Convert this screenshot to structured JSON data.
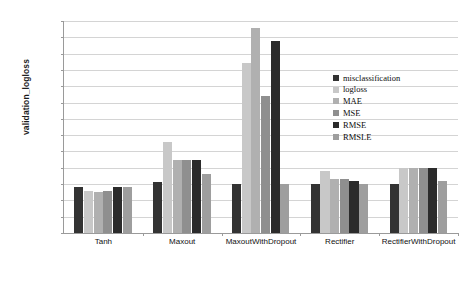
{
  "chart_data": {
    "type": "bar",
    "title": "",
    "xlabel": "",
    "ylabel": "validation_logloss",
    "ylim": [
      0,
      0.65
    ],
    "ytick_labels": [
      "0.65",
      "0.6",
      "0.55",
      "0.5",
      "0.45",
      "0.4",
      "0.35",
      "0.3",
      "0.25",
      "0.2",
      "0.15",
      "0.1",
      "0.05",
      "0"
    ],
    "ytick_values": [
      0.65,
      0.6,
      0.55,
      0.5,
      0.45,
      0.4,
      0.35,
      0.3,
      0.25,
      0.2,
      0.15,
      0.1,
      0.05,
      0
    ],
    "grid": true,
    "legend_position": "inside-upper-right",
    "categories": [
      "Tanh",
      "Maxout",
      "MaxoutWithDropout",
      "Rectifier",
      "RectifierWithDropout"
    ],
    "series": [
      {
        "name": "misclassification",
        "color": "#333333",
        "values": [
          0.14,
          0.155,
          0.15,
          0.15,
          0.15
        ]
      },
      {
        "name": "logloss",
        "color": "#c8c8c8",
        "values": [
          0.13,
          0.28,
          0.52,
          0.19,
          0.2
        ]
      },
      {
        "name": "MAE",
        "color": "#b0b0b0",
        "values": [
          0.125,
          0.225,
          0.63,
          0.165,
          0.2
        ]
      },
      {
        "name": "MSE",
        "color": "#8f8f8f",
        "values": [
          0.13,
          0.225,
          0.42,
          0.165,
          0.2
        ]
      },
      {
        "name": "RMSE",
        "color": "#2b2b2b",
        "values": [
          0.14,
          0.225,
          0.59,
          0.16,
          0.2
        ]
      },
      {
        "name": "RMSLE",
        "color": "#9e9e9e",
        "values": [
          0.14,
          0.18,
          0.15,
          0.15,
          0.16
        ]
      }
    ]
  },
  "legend": {
    "items": [
      {
        "label": "misclassification"
      },
      {
        "label": "logloss"
      },
      {
        "label": "MAE"
      },
      {
        "label": "MSE"
      },
      {
        "label": "RMSE"
      },
      {
        "label": "RMSLE"
      }
    ]
  },
  "axis": {
    "y_title": "validation_logloss"
  }
}
